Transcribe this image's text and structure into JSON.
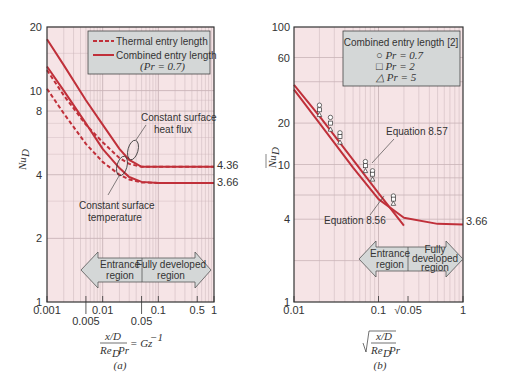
{
  "chart_data": [
    {
      "type": "line",
      "panel": "(a)",
      "xlabel": "x/D / (Re_D Pr) = Gz^-1",
      "ylabel": "Nu_D",
      "xscale": "log",
      "yscale": "log",
      "xlim": [
        0.001,
        1
      ],
      "ylim": [
        1,
        20
      ],
      "x_ticks": [
        "0.001",
        "0.005",
        "0.01",
        "0.05",
        "0.1",
        "0.5",
        "1"
      ],
      "y_ticks": [
        "1",
        "2",
        "4",
        "8",
        "10",
        "20"
      ],
      "grid": true,
      "legend": {
        "position": "upper right",
        "entries": [
          "Thermal entry length",
          "Combined entry length",
          "(Pr = 0.7)"
        ]
      },
      "series": [
        {
          "name": "Combined entry length, constant surface heat flux",
          "style": "solid",
          "x": [
            0.001,
            0.002,
            0.005,
            0.01,
            0.02,
            0.03,
            0.05,
            0.1,
            1
          ],
          "y": [
            17.5,
            13.2,
            9.0,
            6.9,
            5.3,
            4.7,
            4.36,
            4.36,
            4.36
          ]
        },
        {
          "name": "Thermal entry length, constant surface heat flux",
          "style": "dashed",
          "x": [
            0.001,
            0.002,
            0.005,
            0.01,
            0.02,
            0.03,
            0.05,
            0.1,
            1
          ],
          "y": [
            12.5,
            9.5,
            6.9,
            5.7,
            4.8,
            4.5,
            4.36,
            4.36,
            4.36
          ]
        },
        {
          "name": "Combined entry length, constant surface temperature",
          "style": "solid",
          "x": [
            0.001,
            0.002,
            0.005,
            0.01,
            0.02,
            0.03,
            0.05,
            0.1,
            1
          ],
          "y": [
            13.0,
            10.0,
            7.0,
            5.3,
            4.3,
            3.9,
            3.7,
            3.66,
            3.66
          ]
        },
        {
          "name": "Thermal entry length, constant surface temperature",
          "style": "dashed",
          "x": [
            0.001,
            0.002,
            0.005,
            0.01,
            0.02,
            0.03,
            0.05,
            0.1,
            1
          ],
          "y": [
            10.2,
            7.8,
            5.6,
            4.6,
            4.0,
            3.8,
            3.68,
            3.66,
            3.66
          ]
        }
      ],
      "annotations": [
        "Constant surface heat flux",
        "Constant surface temperature",
        "4.36",
        "3.66",
        "Entrance region",
        "Fully developed region"
      ]
    },
    {
      "type": "scatter",
      "panel": "(b)",
      "xlabel": "sqrt( x/D / (Re_D Pr) )",
      "ylabel": "Nu_D (mean)",
      "xscale": "log",
      "yscale": "log",
      "xlim": [
        0.01,
        1
      ],
      "ylim": [
        1,
        100
      ],
      "x_ticks": [
        "0.01",
        "0.1",
        "√0.05",
        "1"
      ],
      "y_ticks": [
        "1",
        "4",
        "10",
        "20",
        "60",
        "100"
      ],
      "grid": true,
      "legend": {
        "position": "upper right",
        "title": "Combined entry length [2]",
        "entries": [
          "○ Pr = 0.7",
          "□ Pr = 2",
          "△ Pr = 5"
        ]
      },
      "series": [
        {
          "name": "Equation 8.57",
          "style": "solid",
          "x": [
            0.01,
            0.02,
            0.05,
            0.1,
            0.2
          ],
          "y": [
            38,
            22.5,
            10.8,
            6.2,
            3.6
          ]
        },
        {
          "name": "Equation 8.56",
          "style": "solid",
          "x": [
            0.01,
            0.02,
            0.05,
            0.1,
            0.2,
            0.5,
            1
          ],
          "y": [
            35,
            20,
            9.5,
            5.6,
            4.1,
            3.7,
            3.66
          ]
        },
        {
          "name": "Pr = 0.7",
          "marker": "circle",
          "x": [
            0.02,
            0.027,
            0.035,
            0.07,
            0.085,
            0.15
          ],
          "y": [
            27,
            22,
            17,
            10.5,
            9,
            5.9
          ]
        },
        {
          "name": "Pr = 2",
          "marker": "square",
          "x": [
            0.02,
            0.027,
            0.035,
            0.07,
            0.085,
            0.15
          ],
          "y": [
            25,
            20,
            16,
            9.8,
            8.5,
            5.6
          ]
        },
        {
          "name": "Pr = 5",
          "marker": "triangle",
          "x": [
            0.02,
            0.027,
            0.035,
            0.07,
            0.085,
            0.15
          ],
          "y": [
            23,
            18,
            14.5,
            9,
            7.8,
            5.2
          ]
        }
      ],
      "annotations": [
        "Equation 8.57",
        "Equation 8.56",
        "3.66",
        "Entrance region",
        "Fully developed region"
      ]
    }
  ],
  "left": {
    "y_ticks": [
      {
        "v": 1,
        "t": "1"
      },
      {
        "v": 2,
        "t": "2"
      },
      {
        "v": 4,
        "t": "4"
      },
      {
        "v": 8,
        "t": "8"
      },
      {
        "v": 10,
        "t": "10"
      },
      {
        "v": 20,
        "t": "20"
      }
    ],
    "x_ticks_top_row": [
      {
        "v": 0.001,
        "t": "0.001"
      },
      {
        "v": 0.01,
        "t": "0.01"
      },
      {
        "v": 0.1,
        "t": "0.1"
      },
      {
        "v": 0.5,
        "t": "0.5"
      },
      {
        "v": 1,
        "t": "1"
      }
    ],
    "x_ticks_bottom_row": [
      {
        "v": 0.005,
        "t": "0.005"
      },
      {
        "v": 0.05,
        "t": "0.05"
      }
    ],
    "ylabel": "Nu",
    "ylabel_sub": "D",
    "legend_dashed": "Thermal entry length",
    "legend_solid": "Combined entry length",
    "legend_pr": "(Pr = 0.7)",
    "ann_flux_1": "Constant surface",
    "ann_flux_2": "heat flux",
    "ann_temp_1": "Constant surface",
    "ann_temp_2": "temperature",
    "val_flux": "4.36",
    "val_temp": "3.66",
    "arrow_left_1": "Entrance",
    "arrow_left_2": "region",
    "arrow_right_1": "Fully developed",
    "arrow_right_2": "region",
    "xlabel_num": "x/D",
    "xlabel_den": "Re",
    "xlabel_den_sub": "D",
    "xlabel_den_pr": "Pr",
    "xlabel_rhs": "= Gz",
    "xlabel_exp": "−1",
    "caption": "(a)"
  },
  "right": {
    "y_ticks": [
      {
        "v": 1,
        "t": "1"
      },
      {
        "v": 4,
        "t": "4"
      },
      {
        "v": 10,
        "t": "10"
      },
      {
        "v": 20,
        "t": "20"
      },
      {
        "v": 60,
        "t": "60"
      },
      {
        "v": 100,
        "t": "100"
      }
    ],
    "x_ticks": [
      {
        "v": 0.01,
        "t": "0.01"
      },
      {
        "v": 0.1,
        "t": "0.1"
      },
      {
        "v": 0.2236,
        "t": "√0.05"
      },
      {
        "v": 1,
        "t": "1"
      }
    ],
    "ylabel": "Nu",
    "ylabel_sub": "D",
    "legend_title": "Combined entry length [2]",
    "legend_1": "○ Pr = 0.7",
    "legend_2": "□ Pr = 2",
    "legend_3": "△ Pr = 5",
    "eq57": "Equation 8.57",
    "eq56": "Equation 8.56",
    "val_temp": "3.66",
    "arrow_left_1": "Entrance",
    "arrow_left_2": "region",
    "arrow_right_1": "Fully",
    "arrow_right_2": "developed",
    "arrow_right_3": "region",
    "xlabel_num": "x/D",
    "xlabel_den": "Re",
    "xlabel_den_sub": "D",
    "xlabel_den_pr": "Pr",
    "caption": "(b)"
  },
  "colors": {
    "curve": "#c0303a",
    "plot_bg": "#f6e4e6",
    "grid": "#c9b4b8",
    "box_bg": "#d4d7d7",
    "frame": "#333333"
  }
}
